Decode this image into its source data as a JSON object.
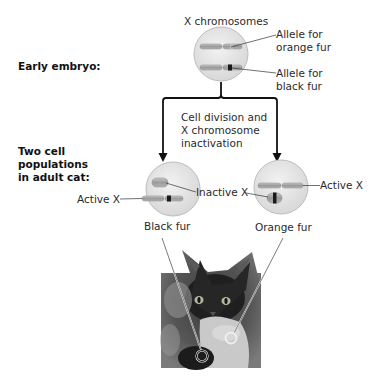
{
  "stages": {
    "early_embryo": {
      "label": "Early embryo:"
    },
    "adult_cat": {
      "label_lines": [
        "Two cell",
        "populations",
        "in adult cat:"
      ]
    }
  },
  "embryo_cell": {
    "title": "X chromosomes",
    "callouts": [
      {
        "lines": [
          "Allele for",
          "orange fur"
        ]
      },
      {
        "lines": [
          "Allele for",
          "black fur"
        ]
      }
    ]
  },
  "process": {
    "lines": [
      "Cell division and",
      "X chromosome",
      "inactivation"
    ]
  },
  "adult_cells": [
    {
      "id": "black",
      "active_label": "Active X",
      "caption": "Black fur"
    },
    {
      "id": "orange",
      "active_label": "Active X",
      "caption": "Orange fur"
    }
  ],
  "shared_label": {
    "inactive": "Inactive X"
  },
  "photo": {
    "subject": "tortoiseshell kitten",
    "markers": [
      "black fur spot",
      "orange fur spot"
    ]
  },
  "colors": {
    "cell_fill": "#e6e6e6",
    "cell_stroke": "#b8b8b8",
    "chromosome": "#a9a9a9",
    "allele_black": "#1a1a1a",
    "arrow": "#111111"
  }
}
